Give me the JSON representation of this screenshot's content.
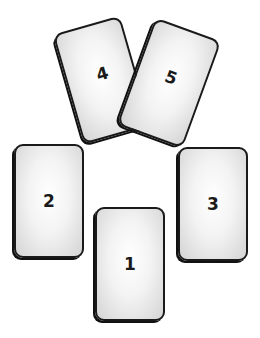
{
  "diagram": {
    "type": "card-spread",
    "cards": [
      {
        "position": "1",
        "label": "1"
      },
      {
        "position": "2",
        "label": "2"
      },
      {
        "position": "3",
        "label": "3"
      },
      {
        "position": "4",
        "label": "4"
      },
      {
        "position": "5",
        "label": "5"
      }
    ]
  }
}
